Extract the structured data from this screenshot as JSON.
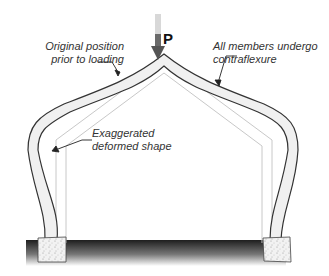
{
  "diagram": {
    "load": {
      "label": "P"
    },
    "annotations": {
      "original_position": [
        "Original position",
        "prior to loading"
      ],
      "contraflexure": [
        "All members undergo",
        "contraflexure"
      ],
      "deformed_shape": [
        "Exaggerated",
        "deformed shape"
      ]
    },
    "colors": {
      "member_outline": "#333333",
      "member_fill": "#f0f0f0",
      "original_frame": "#c8c8c8",
      "load_arrow": "#666666",
      "ground_dark": "#222222",
      "footing_fill": "#eeeeee"
    }
  }
}
